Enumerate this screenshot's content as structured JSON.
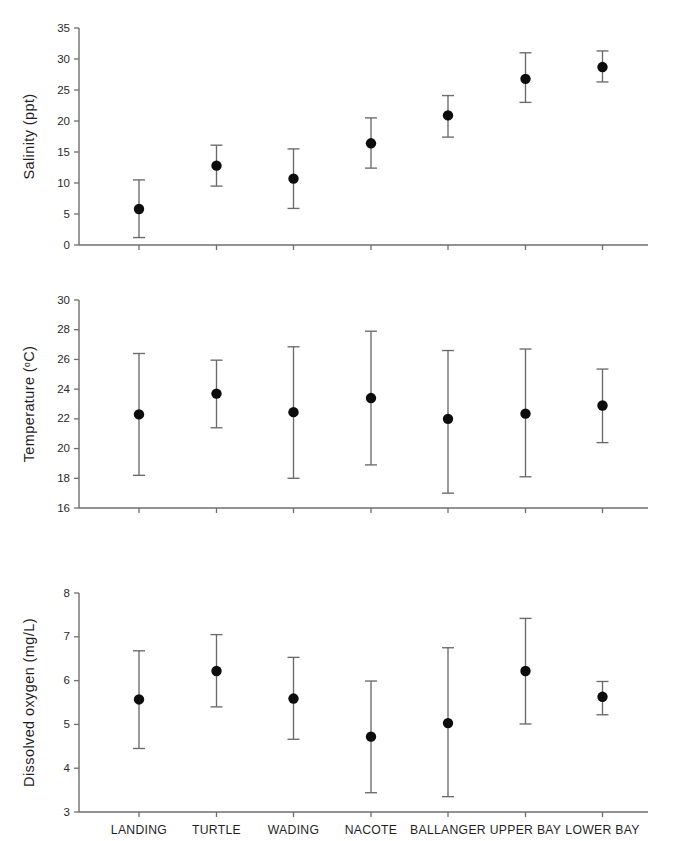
{
  "figure": {
    "categories": [
      "LANDING",
      "TURTLE",
      "WADING",
      "NACOTE",
      "BALLANGER",
      "UPPER BAY",
      "LOWER BAY"
    ],
    "marker_color": "#0d0d0d",
    "error_color": "#6a6a6a",
    "axis_color": "#6e6e6e"
  },
  "chart_data": [
    {
      "type": "scatter",
      "panel": "salinity",
      "title": "",
      "xlabel": "",
      "ylabel": "Salinity (ppt)",
      "ylim": [
        0,
        35
      ],
      "yticks": [
        0,
        5,
        10,
        15,
        20,
        25,
        30,
        35
      ],
      "ytick_labels": [
        "0",
        "5",
        "10",
        "15",
        "20",
        "25",
        "30",
        "35"
      ],
      "grid": false,
      "legend": "none",
      "categories": [
        "LANDING",
        "TURTLE",
        "WADING",
        "NACOTE",
        "BALLANGER",
        "UPPER BAY",
        "LOWER BAY"
      ],
      "values": [
        5.8,
        12.8,
        10.7,
        16.4,
        20.9,
        26.8,
        28.7
      ],
      "err_low": [
        1.2,
        9.5,
        5.9,
        12.4,
        17.4,
        23.0,
        26.3
      ],
      "err_high": [
        10.5,
        16.1,
        15.5,
        20.5,
        24.1,
        31.0,
        31.3
      ]
    },
    {
      "type": "scatter",
      "panel": "temperature",
      "title": "",
      "xlabel": "",
      "ylabel": "Temperature  (°C)",
      "ylabel_main": "Temperature  (",
      "ylabel_sup": "o",
      "ylabel_tail": "C)",
      "ylim": [
        16,
        30
      ],
      "yticks": [
        16,
        18,
        20,
        22,
        24,
        26,
        28,
        30
      ],
      "ytick_labels": [
        "16",
        "18",
        "20",
        "22",
        "24",
        "26",
        "28",
        "30"
      ],
      "grid": false,
      "legend": "none",
      "categories": [
        "LANDING",
        "TURTLE",
        "WADING",
        "NACOTE",
        "BALLANGER",
        "UPPER BAY",
        "LOWER BAY"
      ],
      "values": [
        22.3,
        23.7,
        22.45,
        23.4,
        22.0,
        22.35,
        22.9
      ],
      "err_low": [
        18.2,
        21.4,
        18.0,
        18.9,
        17.0,
        18.1,
        20.4
      ],
      "err_high": [
        26.4,
        25.95,
        26.85,
        27.9,
        26.6,
        26.7,
        25.35
      ]
    },
    {
      "type": "scatter",
      "panel": "oxygen",
      "title": "",
      "xlabel": "",
      "ylabel": "Dissolved oxygen (mg/L)",
      "ylim": [
        3,
        8
      ],
      "yticks": [
        3,
        4,
        5,
        6,
        7,
        8
      ],
      "ytick_labels": [
        "3",
        "4",
        "5",
        "6",
        "7",
        "8"
      ],
      "grid": false,
      "legend": "none",
      "categories": [
        "LANDING",
        "TURTLE",
        "WADING",
        "NACOTE",
        "BALLANGER",
        "UPPER BAY",
        "LOWER BAY"
      ],
      "values": [
        5.57,
        6.22,
        5.59,
        4.72,
        5.03,
        6.22,
        5.63
      ],
      "err_low": [
        4.45,
        5.4,
        4.66,
        3.44,
        3.35,
        5.01,
        5.22
      ],
      "err_high": [
        6.68,
        7.05,
        6.53,
        5.99,
        6.75,
        7.42,
        5.98
      ]
    }
  ]
}
